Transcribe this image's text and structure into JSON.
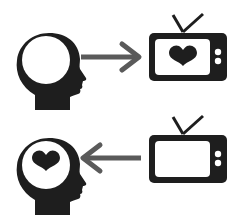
{
  "diagram": {
    "colors": {
      "silhouette": "#1e1e1e",
      "arrow": "#5a5a5a",
      "screen": "#ffffff",
      "background": "#ffffff"
    },
    "rows": [
      {
        "id": "top",
        "left_icon": "head-icon",
        "head_content": "empty",
        "arrow_direction": "right",
        "right_icon": "tv-icon",
        "tv_content": "heart-icon"
      },
      {
        "id": "bottom",
        "left_icon": "head-icon",
        "head_content": "heart-icon",
        "arrow_direction": "left",
        "right_icon": "tv-icon",
        "tv_content": "empty"
      }
    ]
  }
}
